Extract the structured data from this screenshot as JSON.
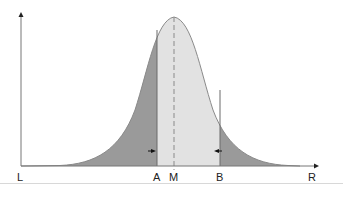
{
  "diagram": {
    "type": "normal-distribution",
    "labels": {
      "left": "L",
      "right": "R",
      "a": "A",
      "mean": "M",
      "b": "B"
    },
    "colors": {
      "tail_fill": "#9a9a9a",
      "center_fill": "#e2e2e2",
      "curve": "#8a8a8a",
      "axis": "#555555",
      "mean_line": "#8a8a8a",
      "arrow": "#111111"
    },
    "regions": [
      {
        "name": "left-tail",
        "from": "L",
        "to": "A",
        "shade": "dark"
      },
      {
        "name": "center",
        "from": "A",
        "to": "B",
        "shade": "light"
      },
      {
        "name": "right-tail",
        "from": "B",
        "to": "R",
        "shade": "dark"
      }
    ],
    "markers": {
      "mean_line_style": "dashed"
    }
  }
}
